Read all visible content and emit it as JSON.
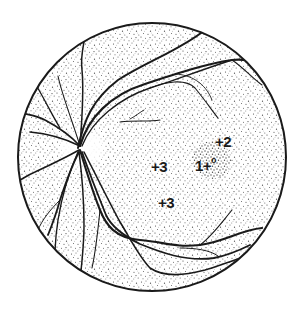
{
  "figure": {
    "type": "fundus-diagram",
    "colors": {
      "outline": "#1a1a1a",
      "stipple": "#3a3a3a",
      "background": "#ffffff",
      "macula": "#2a2a2a"
    }
  },
  "labels": {
    "fovea_number": "1",
    "fovea_plus": "+",
    "fovea_degree": "o",
    "macula_top": "+2",
    "temporal_1": "+3",
    "temporal_2": "+3"
  }
}
